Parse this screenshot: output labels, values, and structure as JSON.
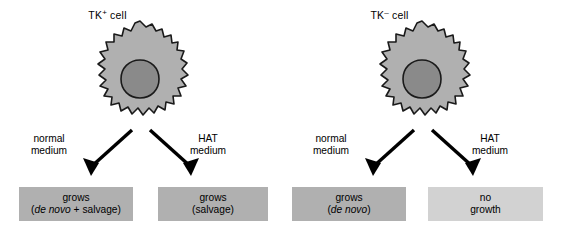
{
  "diagram": {
    "colors": {
      "cytoplasm": "#b0b0b0",
      "nucleus": "#8a8a8a",
      "outline": "#1a1a1a",
      "box_fill": "#b0b0b0",
      "box_fill_light": "#d2d2d2",
      "background": "#ffffff",
      "arrow": "#000000"
    },
    "panels": [
      {
        "id": "tk-plus",
        "cell_label_base": "TK",
        "cell_label_sup": "+",
        "cell_label_suffix": " cell",
        "cell_icon": "amoeboid-cell-with-nucleus",
        "branches": [
          {
            "id": "normal-medium",
            "label_line1": "normal",
            "label_line2": "medium",
            "arrow_icon": "arrow-down-left",
            "result": {
              "line1": "grows",
              "line2_prefix": "(",
              "line2_italic": "de novo",
              "line2_suffix": " + salvage)",
              "shade": "dark"
            }
          },
          {
            "id": "hat-medium",
            "label_line1": "HAT",
            "label_line2": "medium",
            "arrow_icon": "arrow-down-right",
            "result": {
              "line1": "grows",
              "line2_prefix": "(salvage)",
              "line2_italic": "",
              "line2_suffix": "",
              "shade": "dark"
            }
          }
        ]
      },
      {
        "id": "tk-minus",
        "cell_label_base": "TK",
        "cell_label_sup": "–",
        "cell_label_suffix": " cell",
        "cell_icon": "amoeboid-cell-with-nucleus",
        "branches": [
          {
            "id": "normal-medium",
            "label_line1": "normal",
            "label_line2": "medium",
            "arrow_icon": "arrow-down-left",
            "result": {
              "line1": "grows",
              "line2_prefix": "(",
              "line2_italic": "de novo",
              "line2_suffix": ")",
              "shade": "dark"
            }
          },
          {
            "id": "hat-medium",
            "label_line1": "HAT",
            "label_line2": "medium",
            "arrow_icon": "arrow-down-right",
            "result": {
              "line1": "no",
              "line2_prefix": "growth",
              "line2_italic": "",
              "line2_suffix": "",
              "shade": "light"
            }
          }
        ]
      }
    ]
  }
}
